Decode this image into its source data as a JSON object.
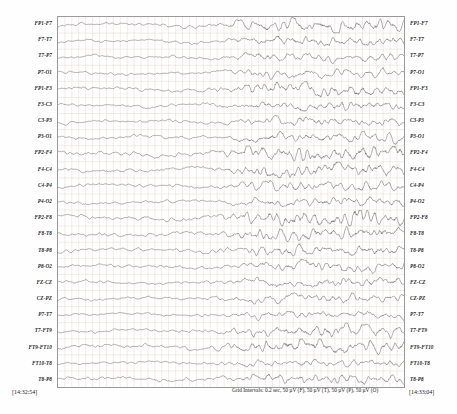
{
  "recording": {
    "timestamp_start": "[14:32:54]",
    "timestamp_end": "[14:33:04]",
    "grid_caption": "Grid Intervals: 0.2 sec, 50 µV (F), 50 µV (T), 50 µV (P), 50 µV (O)",
    "duration_seconds": 10,
    "grid_interval_seconds": 0.2,
    "trace_color": "#3a3a3a",
    "grid_color": "#e6c9c9",
    "frame_color": "#9a9a9a"
  },
  "channels": [
    {
      "label": "FP1-F7",
      "seed": 11,
      "amp": 0.52,
      "burst": 0.95
    },
    {
      "label": "F7-T7",
      "seed": 23,
      "amp": 0.44,
      "burst": 0.85
    },
    {
      "label": "T7-P7",
      "seed": 37,
      "amp": 0.38,
      "burst": 0.8
    },
    {
      "label": "P7-O1",
      "seed": 41,
      "amp": 0.4,
      "burst": 0.78
    },
    {
      "label": "FP1-F3",
      "seed": 53,
      "amp": 0.5,
      "burst": 0.92
    },
    {
      "label": "F3-C3",
      "seed": 67,
      "amp": 0.42,
      "burst": 0.88
    },
    {
      "label": "C3-P3",
      "seed": 71,
      "amp": 0.4,
      "burst": 0.82
    },
    {
      "label": "P3-O1",
      "seed": 83,
      "amp": 0.46,
      "burst": 0.9
    },
    {
      "label": "FP2-F4",
      "seed": 97,
      "amp": 0.58,
      "burst": 1.0
    },
    {
      "label": "F4-C4",
      "seed": 103,
      "amp": 0.54,
      "burst": 0.98
    },
    {
      "label": "C4-P4",
      "seed": 109,
      "amp": 0.44,
      "burst": 0.86
    },
    {
      "label": "P4-O2",
      "seed": 127,
      "amp": 0.42,
      "burst": 0.84
    },
    {
      "label": "FP2-F8",
      "seed": 131,
      "amp": 0.56,
      "burst": 0.99
    },
    {
      "label": "F8-T8",
      "seed": 149,
      "amp": 0.5,
      "burst": 0.93
    },
    {
      "label": "T8-P8",
      "seed": 151,
      "amp": 0.46,
      "burst": 0.88
    },
    {
      "label": "P8-O2",
      "seed": 163,
      "amp": 0.43,
      "burst": 0.85
    },
    {
      "label": "FZ-CZ",
      "seed": 179,
      "amp": 0.41,
      "burst": 0.83
    },
    {
      "label": "CZ-PZ",
      "seed": 191,
      "amp": 0.39,
      "burst": 0.8
    },
    {
      "label": "P7-T7",
      "seed": 197,
      "amp": 0.37,
      "burst": 0.76
    },
    {
      "label": "T7-FT9",
      "seed": 211,
      "amp": 0.48,
      "burst": 0.9
    },
    {
      "label": "FT9-FT10",
      "seed": 223,
      "amp": 0.55,
      "burst": 0.96
    },
    {
      "label": "FT10-T8",
      "seed": 227,
      "amp": 0.36,
      "burst": 0.74
    },
    {
      "label": "T8-P8",
      "seed": 239,
      "amp": 0.45,
      "burst": 0.87
    }
  ],
  "chart_data": {
    "type": "line",
    "xlabel": "Time (sec)",
    "ylabel": "Channel (bipolar derivation)",
    "xlim": [
      0,
      10
    ],
    "grid": true,
    "legend_position": "none",
    "x_tick_interval": 0.2,
    "series_count": 23
  }
}
